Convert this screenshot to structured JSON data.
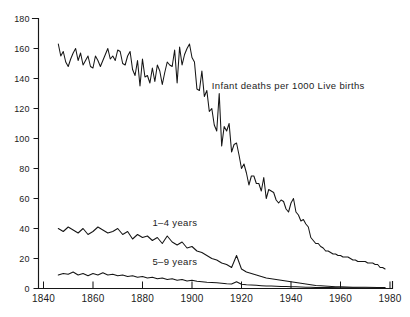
{
  "chart_data": {
    "type": "line",
    "title": "",
    "subtitle": "",
    "xlabel": "",
    "ylabel": "",
    "xlim": [
      1838,
      1981
    ],
    "ylim": [
      0,
      180
    ],
    "grid": false,
    "legend_position": "inline-annotations",
    "xticks": [
      1840,
      1860,
      1880,
      1900,
      1920,
      1940,
      1960,
      1980
    ],
    "xtick_labels": [
      "1840",
      "1860",
      "1880",
      "1900",
      "1920",
      "1940",
      "1960",
      "1980"
    ],
    "yticks": [
      0,
      20,
      40,
      60,
      80,
      100,
      120,
      140,
      160,
      180
    ],
    "ytick_labels": [
      "0",
      "20",
      "40",
      "60",
      "80",
      "100",
      "120",
      "140",
      "160",
      "180"
    ],
    "annotations": [
      {
        "text": "Infant deaths per 1000 Live births",
        "x": 1908,
        "y": 133
      },
      {
        "text": "1–4 years",
        "x": 1884,
        "y": 42
      },
      {
        "text": "5–9 years",
        "x": 1884,
        "y": 16
      }
    ],
    "series": [
      {
        "name": "Infant deaths per 1000 Live births",
        "label_text": "Infant deaths per 1000 Live births",
        "x": [
          1846,
          1847,
          1848,
          1849,
          1850,
          1851,
          1852,
          1853,
          1854,
          1855,
          1856,
          1857,
          1858,
          1859,
          1860,
          1861,
          1862,
          1863,
          1864,
          1865,
          1866,
          1867,
          1868,
          1869,
          1870,
          1871,
          1872,
          1873,
          1874,
          1875,
          1876,
          1877,
          1878,
          1879,
          1880,
          1881,
          1882,
          1883,
          1884,
          1885,
          1886,
          1887,
          1888,
          1889,
          1890,
          1891,
          1892,
          1893,
          1894,
          1895,
          1896,
          1897,
          1898,
          1899,
          1900,
          1901,
          1902,
          1903,
          1904,
          1905,
          1906,
          1907,
          1908,
          1909,
          1910,
          1911,
          1912,
          1913,
          1914,
          1915,
          1916,
          1917,
          1918,
          1919,
          1920,
          1921,
          1922,
          1923,
          1924,
          1925,
          1926,
          1927,
          1928,
          1929,
          1930,
          1931,
          1932,
          1933,
          1934,
          1935,
          1936,
          1937,
          1938,
          1939,
          1940,
          1941,
          1942,
          1943,
          1944,
          1945,
          1946,
          1947,
          1948,
          1949,
          1950,
          1951,
          1952,
          1953,
          1954,
          1955,
          1956,
          1957,
          1958,
          1959,
          1960,
          1961,
          1962,
          1963,
          1964,
          1965,
          1966,
          1967,
          1968,
          1969,
          1970,
          1971,
          1972,
          1973,
          1974,
          1975,
          1976,
          1977,
          1978
        ],
        "y": [
          163,
          155,
          158,
          151,
          148,
          153,
          157,
          160,
          152,
          157,
          149,
          152,
          155,
          148,
          147,
          155,
          152,
          148,
          152,
          156,
          160,
          153,
          155,
          152,
          159,
          158,
          150,
          149,
          155,
          158,
          146,
          142,
          152,
          135,
          153,
          141,
          142,
          137,
          147,
          138,
          149,
          145,
          136,
          144,
          151,
          149,
          148,
          159,
          137,
          161,
          149,
          156,
          160,
          163,
          154,
          151,
          133,
          132,
          145,
          128,
          132,
          118,
          120,
          109,
          105,
          130,
          95,
          108,
          105,
          110,
          91,
          96,
          97,
          89,
          80,
          83,
          77,
          69,
          75,
          75,
          70,
          70,
          65,
          74,
          60,
          66,
          65,
          64,
          59,
          57,
          59,
          58,
          53,
          51,
          57,
          60,
          51,
          49,
          45,
          46,
          43,
          41,
          34,
          32,
          30,
          30,
          28,
          27,
          25,
          25,
          24,
          23,
          23,
          22,
          22,
          21,
          21,
          21,
          20,
          19,
          19,
          18,
          18,
          18,
          18,
          17,
          17,
          17,
          16,
          16,
          14,
          14,
          13
        ]
      },
      {
        "name": "1–4 years",
        "label_text": "1–4 years",
        "x": [
          1846,
          1848,
          1850,
          1852,
          1854,
          1856,
          1858,
          1860,
          1862,
          1864,
          1866,
          1868,
          1870,
          1872,
          1874,
          1876,
          1878,
          1880,
          1882,
          1884,
          1886,
          1888,
          1890,
          1892,
          1894,
          1896,
          1898,
          1900,
          1902,
          1904,
          1906,
          1908,
          1910,
          1912,
          1914,
          1916,
          1918,
          1920,
          1922,
          1924,
          1926,
          1928,
          1930,
          1932,
          1934,
          1936,
          1938,
          1940,
          1942,
          1944,
          1946,
          1948,
          1950,
          1952,
          1955,
          1958,
          1960,
          1965,
          1970,
          1975,
          1978
        ],
        "y": [
          40,
          38,
          41,
          39,
          37,
          40,
          36,
          38,
          41,
          39,
          37,
          38,
          40,
          36,
          38,
          33,
          36,
          34,
          35,
          32,
          34,
          30,
          35,
          31,
          29,
          31,
          27,
          28,
          25,
          24,
          22,
          20,
          19,
          17,
          16,
          14,
          22,
          13,
          11,
          10,
          9,
          8,
          7,
          6.5,
          6,
          5.5,
          5,
          4.5,
          4,
          3.5,
          3,
          2.5,
          2,
          1.8,
          1.5,
          1.2,
          1.1,
          0.9,
          0.8,
          0.7,
          0.7
        ]
      },
      {
        "name": "5–9 years",
        "label_text": "5–9 years",
        "x": [
          1846,
          1848,
          1850,
          1852,
          1854,
          1856,
          1858,
          1860,
          1862,
          1864,
          1866,
          1868,
          1870,
          1872,
          1874,
          1876,
          1878,
          1880,
          1882,
          1884,
          1886,
          1888,
          1890,
          1892,
          1894,
          1896,
          1898,
          1900,
          1902,
          1904,
          1906,
          1908,
          1910,
          1912,
          1914,
          1916,
          1918,
          1920,
          1922,
          1924,
          1926,
          1928,
          1930,
          1932,
          1934,
          1936,
          1938,
          1940,
          1942,
          1944,
          1946,
          1948,
          1950,
          1955,
          1960,
          1965,
          1970,
          1975,
          1978
        ],
        "y": [
          9,
          10,
          9.5,
          11,
          9,
          10,
          8.5,
          10,
          9,
          10.5,
          9,
          9.5,
          8.5,
          9,
          8,
          8.5,
          7.5,
          8,
          7,
          7.5,
          6.5,
          7,
          6,
          6.5,
          5.5,
          6,
          5,
          5.5,
          4.8,
          4.5,
          4.2,
          4,
          3.8,
          3.5,
          3.2,
          3,
          4.5,
          2.8,
          2.5,
          2.3,
          2.1,
          1.9,
          1.7,
          1.6,
          1.5,
          1.4,
          1.3,
          1.2,
          1.1,
          1,
          0.9,
          0.8,
          0.7,
          0.6,
          0.5,
          0.45,
          0.4,
          0.35,
          0.35
        ]
      }
    ]
  },
  "colors": {
    "line": "#151515",
    "axis": "#171717",
    "background": "#ffffff",
    "text": "#1c1c1c"
  }
}
